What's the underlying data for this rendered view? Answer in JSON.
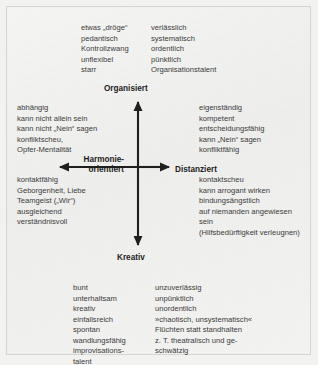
{
  "diagram": {
    "type": "quadrant-model",
    "axes": {
      "top_label": "Organisiert",
      "bottom_label": "Kreativ",
      "left_label_line1": "Harmonie-",
      "left_label_line2": "orientiert",
      "right_label": "Distanziert"
    },
    "quadrants": {
      "organisiert_negative": {
        "terms": [
          "etwas „dröge“",
          "pedantisch",
          "Kontrollzwang",
          "unflexibel",
          "starr"
        ]
      },
      "organisiert_positive": {
        "terms": [
          "verlässlich",
          "systematisch",
          "ordentlich",
          "pünktlich",
          "Organisationstalent"
        ]
      },
      "harmonie_negative": {
        "terms": [
          "abhängig",
          "kann nicht allein sein",
          "kann nicht „Nein“ sagen",
          "konfliktscheu,",
          "Opfer-Mentalität"
        ]
      },
      "harmonie_positive": {
        "terms": [
          "kontaktfähig",
          "Geborgenheit, Liebe",
          "Teamgeist („Wir“)",
          "ausgleichend",
          "verständnisvoll"
        ]
      },
      "distanziert_positive": {
        "terms": [
          "eigenständig",
          "kompetent",
          "entscheidungsfähig",
          "kann „Nein“ sagen",
          "konfliktfähig"
        ]
      },
      "distanziert_negative": {
        "terms": [
          "kontaktscheu",
          "kann arrogant wirken",
          "bindungsängstlich",
          "auf niemanden angewiesen",
          "sein",
          "(Hilfsbedürftigkeit verleugnen)"
        ]
      },
      "kreativ_positive": {
        "terms": [
          "bunt",
          "unterhaltsam",
          "kreativ",
          "einfallsreich",
          "spontan",
          "wandlungsfähig",
          "improvisations-",
          "talent"
        ]
      },
      "kreativ_negative": {
        "terms": [
          "unzuverlässig",
          "unpünktlich",
          "unordentlich",
          "»chaotisch, unsystematisch«",
          "Flüchten statt standhalten",
          "z. T. theatralisch und ge-",
          "schwätzig"
        ]
      }
    },
    "colors": {
      "background": "#f2f2f0",
      "border": "#d4d4d2",
      "text": "#3b3b3b",
      "label": "#1d1d1d",
      "axis": "#1f1f1f"
    }
  }
}
